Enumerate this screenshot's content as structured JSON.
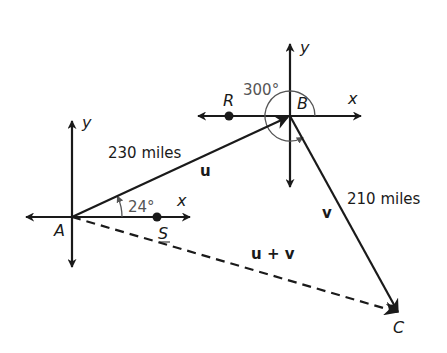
{
  "diagram": {
    "type": "vector-navigation",
    "points": {
      "A": {
        "label": "A"
      },
      "B": {
        "label": "B"
      },
      "C": {
        "label": "C"
      },
      "R": {
        "label": "R"
      },
      "S": {
        "label": "S"
      }
    },
    "axes": {
      "x_label": "x",
      "y_label": "y"
    },
    "vectors": {
      "u": {
        "label": "u",
        "from": "A",
        "to": "B",
        "magnitude_label": "230 miles",
        "magnitude": 230,
        "unit": "miles"
      },
      "v": {
        "label": "v",
        "from": "B",
        "to": "C",
        "magnitude_label": "210 miles",
        "magnitude": 210,
        "unit": "miles"
      },
      "sum": {
        "label": "u + v",
        "from": "A",
        "to": "C",
        "style": "dashed"
      }
    },
    "angles": {
      "at_A": {
        "label": "24°",
        "value_deg": 24
      },
      "at_B": {
        "label": "300°",
        "value_deg": 300
      }
    },
    "colors": {
      "ink": "#1a1a1a",
      "angle_arc": "#555555"
    }
  }
}
